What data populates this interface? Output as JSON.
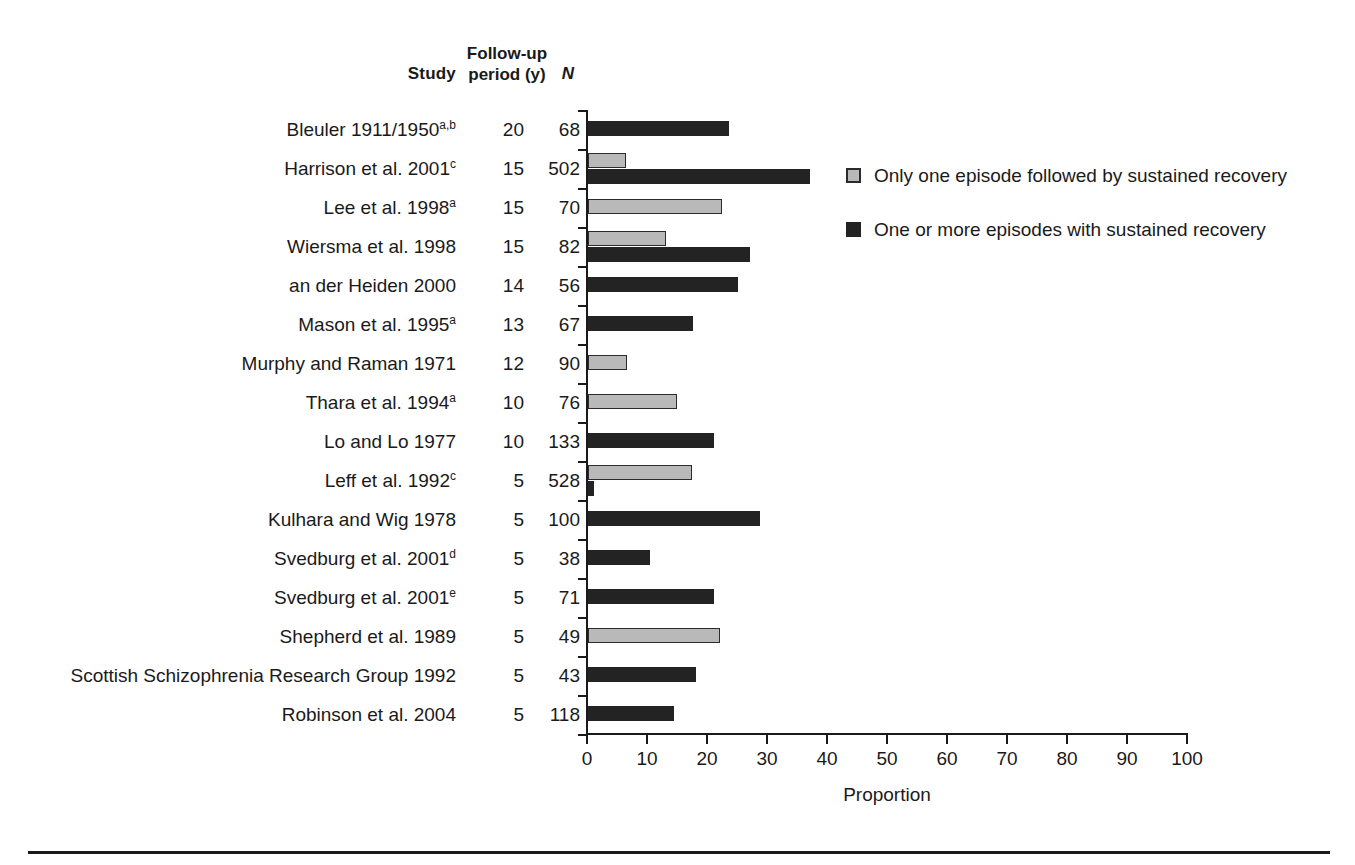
{
  "table_headers": {
    "study": "Study",
    "followup_line1": "Follow-up",
    "followup_line2": "period (y)",
    "n": "N"
  },
  "legend": {
    "items": [
      {
        "key": "light",
        "label": "Only one episode followed by sustained recovery",
        "color": "#b9b9b9"
      },
      {
        "key": "dark",
        "label": "One or more episodes with sustained recovery",
        "color": "#232323"
      }
    ]
  },
  "axis": {
    "title": "Proportion",
    "ticks": [
      "0",
      "10",
      "20",
      "30",
      "40",
      "50",
      "60",
      "70",
      "80",
      "90",
      "100"
    ],
    "min": 0,
    "max": 100
  },
  "chart_data": {
    "type": "bar",
    "orientation": "horizontal",
    "title": "",
    "xlabel": "Proportion",
    "ylabel": "Study",
    "xlim": [
      0,
      100
    ],
    "grid": false,
    "legend_position": "right",
    "categories": [
      "Bleuler 1911/1950",
      "Harrison et al. 2001",
      "Lee et al. 1998",
      "Wiersma et al. 1998",
      "an der Heiden 2000",
      "Mason et al. 1995",
      "Murphy and Raman 1971",
      "Thara et al. 1994",
      "Lo and Lo 1977",
      "Leff et al. 1992",
      "Kulhara and Wig 1978",
      "Svedburg et al. 2001",
      "Svedburg et al. 2001",
      "Shepherd et al. 1989",
      "Scottish Schizophrenia Research Group 1992",
      "Robinson et al. 2004"
    ],
    "series": [
      {
        "name": "Only one episode followed by sustained recovery",
        "color": "#b9b9b9",
        "values": [
          null,
          6.3,
          22.3,
          13.0,
          null,
          null,
          6.5,
          14.8,
          null,
          17.3,
          null,
          null,
          null,
          22.0,
          null,
          null
        ]
      },
      {
        "name": "One or more episodes with sustained recovery",
        "color": "#232323",
        "values": [
          23.5,
          37.0,
          null,
          27.0,
          25.0,
          17.5,
          null,
          null,
          21.0,
          1.0,
          28.7,
          10.3,
          21.0,
          null,
          18.0,
          14.3
        ]
      }
    ],
    "rows": [
      {
        "study": "Bleuler 1911/1950",
        "sup": "a,b",
        "followup": "20",
        "n": "68",
        "light": null,
        "dark": 23.5
      },
      {
        "study": "Harrison et al. 2001",
        "sup": "c",
        "followup": "15",
        "n": "502",
        "light": 6.3,
        "dark": 37.0
      },
      {
        "study": "Lee et al. 1998",
        "sup": "a",
        "followup": "15",
        "n": "70",
        "light": 22.3,
        "dark": null
      },
      {
        "study": "Wiersma et al. 1998",
        "sup": "",
        "followup": "15",
        "n": "82",
        "light": 13.0,
        "dark": 27.0
      },
      {
        "study": "an der Heiden 2000",
        "sup": "",
        "followup": "14",
        "n": "56",
        "light": null,
        "dark": 25.0
      },
      {
        "study": "Mason et al. 1995",
        "sup": "a",
        "followup": "13",
        "n": "67",
        "light": null,
        "dark": 17.5
      },
      {
        "study": "Murphy and Raman 1971",
        "sup": "",
        "followup": "12",
        "n": "90",
        "light": 6.5,
        "dark": null
      },
      {
        "study": "Thara et al. 1994",
        "sup": "a",
        "followup": "10",
        "n": "76",
        "light": 14.8,
        "dark": null
      },
      {
        "study": "Lo and Lo 1977",
        "sup": "",
        "followup": "10",
        "n": "133",
        "light": null,
        "dark": 21.0
      },
      {
        "study": "Leff et al. 1992",
        "sup": "c",
        "followup": "5",
        "n": "528",
        "light": 17.3,
        "dark": 1.0
      },
      {
        "study": "Kulhara and Wig 1978",
        "sup": "",
        "followup": "5",
        "n": "100",
        "light": null,
        "dark": 28.7
      },
      {
        "study": "Svedburg et al. 2001",
        "sup": "d",
        "followup": "5",
        "n": "38",
        "light": null,
        "dark": 10.3
      },
      {
        "study": "Svedburg et al. 2001",
        "sup": "e",
        "followup": "5",
        "n": "71",
        "light": null,
        "dark": 21.0
      },
      {
        "study": "Shepherd et al. 1989",
        "sup": "",
        "followup": "5",
        "n": "49",
        "light": 22.0,
        "dark": null
      },
      {
        "study": "Scottish Schizophrenia Research Group 1992",
        "sup": "",
        "followup": "5",
        "n": "43",
        "light": null,
        "dark": 18.0
      },
      {
        "study": "Robinson et al. 2004",
        "sup": "",
        "followup": "5",
        "n": "118",
        "light": null,
        "dark": 14.3
      }
    ]
  }
}
